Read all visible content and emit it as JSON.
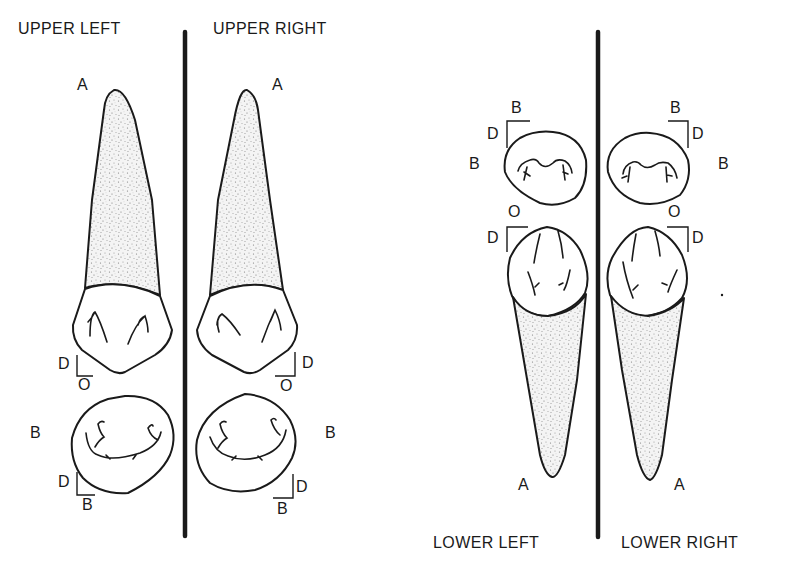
{
  "quadrants": {
    "upper_left": "UPPER LEFT",
    "upper_right": "UPPER RIGHT",
    "lower_left": "LOWER LEFT",
    "lower_right": "LOWER RIGHT"
  },
  "upper_left": {
    "apex_label": "A",
    "crown_axis": {
      "horizontal": "D",
      "vertical": "O"
    },
    "occlusal_side_label": "B",
    "occlusal_axis": {
      "horizontal": "D",
      "vertical": "B"
    }
  },
  "upper_right": {
    "apex_label": "A",
    "crown_axis": {
      "horizontal": "D",
      "vertical": "O"
    },
    "occlusal_side_label": "B",
    "occlusal_axis": {
      "horizontal": "D",
      "vertical": "B"
    }
  },
  "lower_left": {
    "occlusal_axis": {
      "horizontal": "D",
      "vertical": "B"
    },
    "occlusal_side_label": "B",
    "crown_axis": {
      "horizontal": "D",
      "vertical": "O"
    },
    "apex_label": "A"
  },
  "lower_right": {
    "occlusal_axis": {
      "horizontal": "D",
      "vertical": "B"
    },
    "occlusal_side_label": "B",
    "crown_axis": {
      "horizontal": "D",
      "vertical": "O"
    },
    "apex_label": "A"
  },
  "colors": {
    "ink": "#1a1a1a",
    "background": "#ffffff",
    "stipple": "#8a8a8a"
  }
}
